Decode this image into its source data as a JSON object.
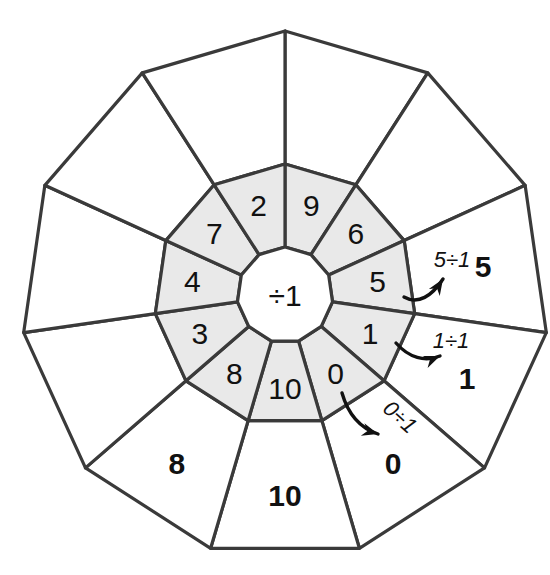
{
  "figure": {
    "operation": "÷1",
    "hub_label": "÷1",
    "sector_count": 11,
    "colors": {
      "inner_ring_fill": "#e9e9e9",
      "outer_ring_fill": "#ffffff",
      "stroke": "#3a3a3a",
      "text": "#111111",
      "background": "#ffffff"
    },
    "geometry": {
      "center_x": 285,
      "center_y": 295,
      "hub_radius": 48,
      "inner_radius": 131,
      "outer_radius": 264,
      "start_angle_deg": -90
    }
  },
  "sectors": [
    {
      "index": 0,
      "inner": "9",
      "outer": "",
      "outer_filled": false
    },
    {
      "index": 1,
      "inner": "6",
      "outer": "",
      "outer_filled": false
    },
    {
      "index": 2,
      "inner": "5",
      "outer": "5",
      "outer_filled": true
    },
    {
      "index": 3,
      "inner": "1",
      "outer": "1",
      "outer_filled": true
    },
    {
      "index": 4,
      "inner": "0",
      "outer": "0",
      "outer_filled": true
    },
    {
      "index": 5,
      "inner": "10",
      "outer": "10",
      "outer_filled": true
    },
    {
      "index": 6,
      "inner": "8",
      "outer": "8",
      "outer_filled": true
    },
    {
      "index": 7,
      "inner": "3",
      "outer": "",
      "outer_filled": false
    },
    {
      "index": 8,
      "inner": "4",
      "outer": "",
      "outer_filled": false
    },
    {
      "index": 9,
      "inner": "7",
      "outer": "",
      "outer_filled": false
    },
    {
      "index": 10,
      "inner": "2",
      "outer": "",
      "outer_filled": false
    }
  ],
  "annotations": [
    {
      "id": "annot-5",
      "text": "5÷1",
      "x": 452,
      "y": 259,
      "rotation": 0,
      "arrow": {
        "start_x": 404,
        "start_y": 297,
        "c1x": 418,
        "c1y": 305,
        "c2x": 432,
        "c2y": 296,
        "end_x": 443,
        "end_y": 279,
        "head_angle": -57
      }
    },
    {
      "id": "annot-1",
      "text": "1÷1",
      "x": 451,
      "y": 340,
      "rotation": 0,
      "arrow": {
        "start_x": 396,
        "start_y": 343,
        "c1x": 409,
        "c1y": 358,
        "c2x": 425,
        "c2y": 362,
        "end_x": 440,
        "end_y": 356,
        "head_angle": -22
      }
    },
    {
      "id": "annot-0",
      "text": "0÷1",
      "x": 400,
      "y": 417,
      "rotation": 42,
      "arrow": {
        "start_x": 342,
        "start_y": 393,
        "c1x": 348,
        "c1y": 414,
        "c2x": 360,
        "c2y": 428,
        "end_x": 378,
        "end_y": 434,
        "head_angle": 16
      }
    }
  ]
}
